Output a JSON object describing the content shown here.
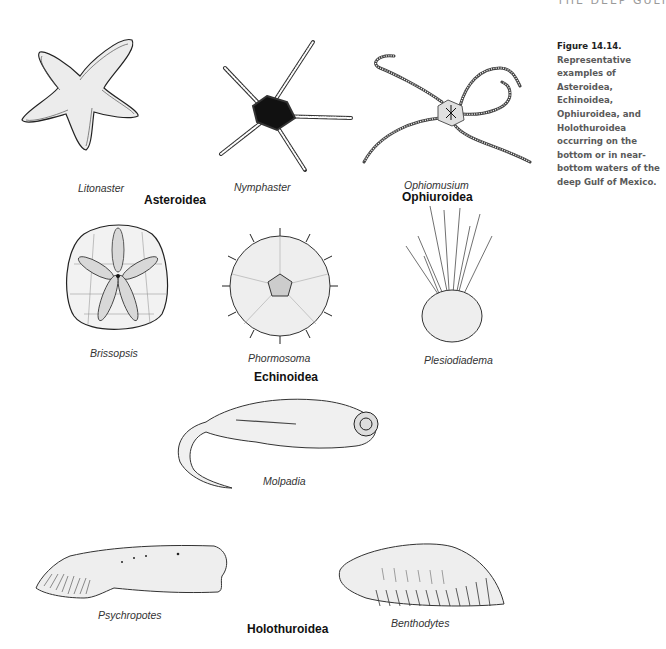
{
  "running_head": "THE DEEP GULF",
  "caption": {
    "figure_label": "Figure 14.14.",
    "text": "Representative examples of Asteroidea, Echinoidea, Ophiuroidea, and Holothuroidea occurring on the bottom or in near-bottom waters of the deep Gulf of Mexico."
  },
  "groups": {
    "asteroidea": "Asteroidea",
    "ophiuroidea": "Ophiuroidea",
    "echinoidea": "Echinoidea",
    "holothuroidea": "Holothuroidea"
  },
  "species": {
    "litonaster": "Litonaster",
    "nymphaster": "Nymphaster",
    "ophiomusium": "Ophiomusium",
    "brissopsis": "Brissopsis",
    "phormosoma": "Phormosoma",
    "plesiodiadema": "Plesiodiadema",
    "molpadia": "Molpadia",
    "psychropotes": "Psychropotes",
    "benthodytes": "Benthodytes"
  }
}
